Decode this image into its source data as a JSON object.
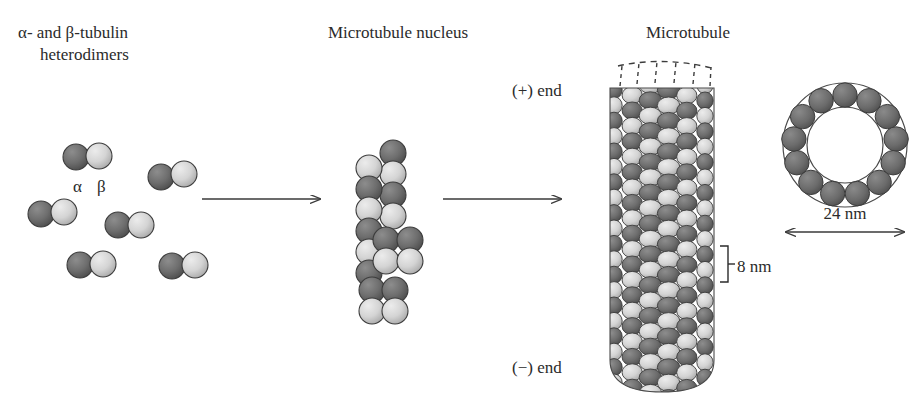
{
  "figure": {
    "title_left": "α- and β-tubulin\nheterodimers",
    "title_left_line1": "α- and β-tubulin",
    "title_left_line2": "heterodimers",
    "title_middle": "Microtubule nucleus",
    "title_right": "Microtubule",
    "alpha_label": "α",
    "beta_label": "β",
    "plus_end_label": "(+) end",
    "minus_end_label": "(−) end",
    "subunit_rise_label": "8 nm",
    "diameter_label": "24 nm",
    "background": "#ffffff"
  },
  "colors": {
    "alpha_subunit": "#6e6e6e",
    "alpha_subunit_dark": "#4d4d4d",
    "beta_subunit": "#d6d6d6",
    "beta_subunit_dark": "#a9a9a9",
    "outline": "#3c3c3c",
    "text": "#2b2b2b",
    "arrow": "#3a3a3a",
    "cross_section_fill": "#6b6b6b"
  },
  "heterodimers": [
    {
      "name": "heterodimer-1",
      "alpha_x": 76,
      "alpha_y": 157,
      "beta_x": 99,
      "beta_y": 156
    },
    {
      "name": "heterodimer-2",
      "alpha_x": 161,
      "alpha_y": 176,
      "beta_x": 184,
      "beta_y": 174
    },
    {
      "name": "heterodimer-3",
      "alpha_x": 41,
      "alpha_y": 213,
      "beta_x": 64,
      "beta_y": 211
    },
    {
      "name": "heterodimer-4",
      "alpha_x": 118,
      "alpha_y": 224,
      "beta_x": 141,
      "beta_y": 224
    },
    {
      "name": "heterodimer-5",
      "alpha_x": 80,
      "alpha_y": 264,
      "beta_x": 103,
      "beta_y": 263
    },
    {
      "name": "heterodimer-6",
      "alpha_x": 172,
      "alpha_y": 265,
      "beta_x": 195,
      "beta_y": 264
    }
  ],
  "arrows": [
    {
      "name": "arrow-nucleation",
      "x1": 202,
      "y1": 199,
      "x2": 320,
      "y2": 199
    },
    {
      "name": "arrow-elongation",
      "x1": 443,
      "y1": 199,
      "x2": 561,
      "y2": 199
    }
  ],
  "nucleus": {
    "columns": 3,
    "rows": 7,
    "description": "staggered protofilament oligomer of alternating alpha and beta tubulin subunits"
  },
  "microtubule": {
    "protofilaments_visible": 6,
    "rows": 21,
    "dashed_growth_marks": 5,
    "top_y": 88,
    "bottom_y": 390
  },
  "cross_section": {
    "subunit_count": 13,
    "center_x": 845,
    "center_y": 145,
    "outer_radius": 63,
    "inner_radius": 38
  }
}
